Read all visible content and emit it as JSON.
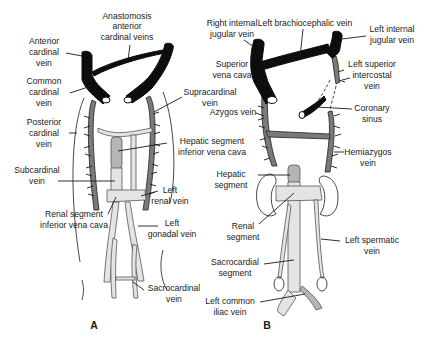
{
  "figure": {
    "panels": [
      {
        "id": "A",
        "label": "A",
        "labels": {
          "anastomosis": [
            "Anastomosis",
            "anterior",
            "cardinal veins"
          ],
          "anterior_cardinal": [
            "Anterior",
            "cardinal",
            "vein"
          ],
          "common_cardinal": [
            "Common",
            "cardinal",
            "vein"
          ],
          "supracardinal": [
            "Supracardinal",
            "vein"
          ],
          "posterior_cardinal": [
            "Posterior",
            "cardinal",
            "vein"
          ],
          "hepatic_segment": [
            "Hepatic segment",
            "inferior vena cava"
          ],
          "subcardinal": [
            "Subcardinal",
            "vein"
          ],
          "left_renal": [
            "Left",
            "renal vein"
          ],
          "renal_segment": [
            "Renal segment",
            "inferior vena cava"
          ],
          "left_gonadal": [
            "Left",
            "gonadal vein"
          ],
          "sacrocardinal": [
            "Sacrocardinal",
            "vein"
          ]
        }
      },
      {
        "id": "B",
        "label": "B",
        "labels": {
          "right_internal_jugular": [
            "Right internal",
            "jugular vein"
          ],
          "left_brachiocephalic": [
            "Left brachiocephalic vein"
          ],
          "left_internal_jugular": [
            "Left internal",
            "jugular vein"
          ],
          "superior_vena_cava": [
            "Superior",
            "vena cava"
          ],
          "left_superior_intercostal": [
            "Left superior",
            "intercostal",
            "vein"
          ],
          "azygos": [
            "Azygos vein"
          ],
          "coronary_sinus": [
            "Coronary",
            "sinus"
          ],
          "hemiazygos": [
            "Hemiazygos",
            "vein"
          ],
          "hepatic_segment": [
            "Hepatic",
            "segment"
          ],
          "renal_segment": [
            "Renal",
            "segment"
          ],
          "left_spermatic": [
            "Left spermatic",
            "vein"
          ],
          "sacrocardial_segment": [
            "Sacrocardial",
            "segment"
          ],
          "left_common_iliac": [
            "Left common",
            "iliac vein"
          ]
        }
      }
    ],
    "legend_colors": {
      "anterior_cardinal_system": "#0d0d0d",
      "supracardinal_system": "#7a7a7a",
      "subcardinal_system": "#e4e4e4",
      "vitelline_hepatic": "#b5b5b5"
    }
  }
}
